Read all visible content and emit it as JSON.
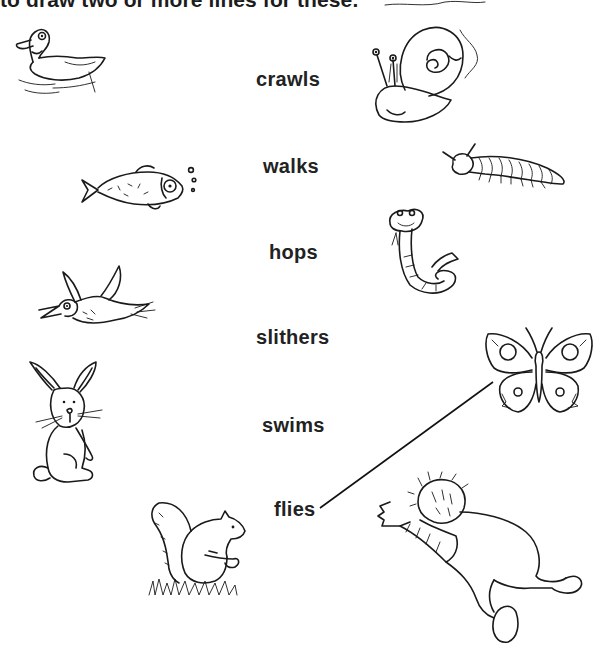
{
  "worksheet": {
    "instruction": "to draw two or more lines for these.",
    "verbs": [
      {
        "id": "crawls",
        "label": "crawls"
      },
      {
        "id": "walks",
        "label": "walks"
      },
      {
        "id": "hops",
        "label": "hops"
      },
      {
        "id": "slithers",
        "label": "slithers"
      },
      {
        "id": "swims",
        "label": "swims"
      },
      {
        "id": "flies",
        "label": "flies"
      }
    ],
    "pictures_left": [
      "duck",
      "fish",
      "bird",
      "rabbit",
      "squirrel"
    ],
    "pictures_right": [
      "snail",
      "caterpillar",
      "snake",
      "butterfly",
      "crawling-baby"
    ],
    "drawn_lines": [
      {
        "from": "flies",
        "to": "butterfly",
        "x1": 320,
        "y1": 508,
        "x2": 493,
        "y2": 382
      }
    ]
  }
}
